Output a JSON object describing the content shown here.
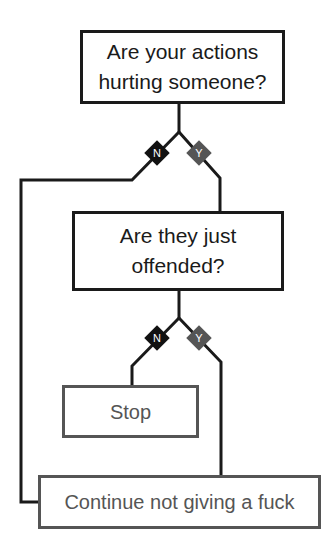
{
  "flowchart": {
    "questions": [
      {
        "id": "q1",
        "text_line1": "Are your actions",
        "text_line2": "hurting someone?"
      },
      {
        "id": "q2",
        "text_line1": "Are they just",
        "text_line2": "offended?"
      }
    ],
    "outcomes": [
      {
        "id": "stop",
        "text": "Stop"
      },
      {
        "id": "continue",
        "text": "Continue not giving a fuck"
      }
    ],
    "branches": {
      "no_label": "N",
      "yes_label": "Y"
    },
    "edges": [
      {
        "from": "q1",
        "label": "N",
        "to": "continue"
      },
      {
        "from": "q1",
        "label": "Y",
        "to": "q2"
      },
      {
        "from": "q2",
        "label": "N",
        "to": "stop"
      },
      {
        "from": "q2",
        "label": "Y",
        "to": "continue"
      }
    ],
    "colors": {
      "question_border": "#1a1a1a",
      "outcome_border": "#555555",
      "no_diamond": "#111111",
      "yes_diamond": "#555555"
    }
  }
}
